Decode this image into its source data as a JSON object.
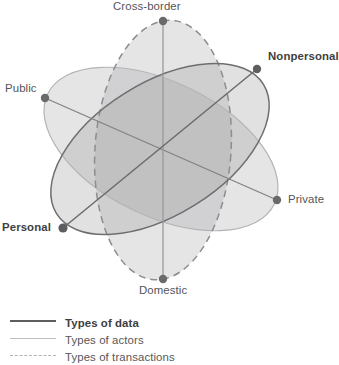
{
  "diagram": {
    "title": "",
    "type": "three-ellipse-venn",
    "vertices": [
      {
        "id": "cross-border",
        "label": "Cross-border",
        "bold": false,
        "x": 163,
        "y": 21
      },
      {
        "id": "nonpersonal",
        "label": "Nonpersonal",
        "bold": true,
        "x": 257,
        "y": 69
      },
      {
        "id": "private",
        "label": "Private",
        "bold": false,
        "x": 277,
        "y": 200
      },
      {
        "id": "domestic",
        "label": "Domestic",
        "bold": false,
        "x": 163,
        "y": 279
      },
      {
        "id": "personal",
        "label": "Personal",
        "bold": true,
        "x": 63,
        "y": 228
      },
      {
        "id": "public",
        "label": "Public",
        "bold": false,
        "x": 45,
        "y": 98
      }
    ],
    "ellipses": [
      {
        "id": "types-of-data",
        "name": "Types of data",
        "stroke": "#6e6e71",
        "style": "solid",
        "fill": "#b9b9bb",
        "axis_from": "personal",
        "axis_to": "nonpersonal"
      },
      {
        "id": "types-of-actors",
        "name": "Types of actors",
        "stroke": "#b4b4b6",
        "style": "solid",
        "fill": "#dedee0",
        "axis_from": "public",
        "axis_to": "private"
      },
      {
        "id": "types-of-transactions",
        "name": "Types of transactions",
        "stroke": "#8d8d90",
        "style": "dashed",
        "fill": "#d2d2d4",
        "axis_from": "cross-border",
        "axis_to": "domestic"
      }
    ],
    "colors": {
      "vertex_dot": "#6a6a6d",
      "label_text": "#555557",
      "label_text_bold": "#3f3f41",
      "background": "#ffffff"
    }
  },
  "legend": {
    "items": [
      {
        "id": "types-of-data",
        "label": "Types of data",
        "line_style": "solid-thick",
        "bold": true,
        "color": "#5d5d60"
      },
      {
        "id": "types-of-actors",
        "label": "Types of actors",
        "line_style": "solid-thin",
        "bold": false,
        "color": "#c0c0c2"
      },
      {
        "id": "types-of-transactions",
        "label": "Types of transactions",
        "line_style": "dashed",
        "bold": false,
        "color": "#b3b3b5"
      }
    ]
  }
}
